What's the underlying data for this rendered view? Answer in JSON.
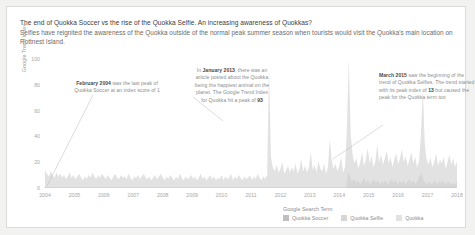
{
  "header": {
    "title": "The end of Quokka Soccer vs the rise of the Quokka Selfie. An increasing awareness of Quokkas?",
    "subtitle": "Selfies have reignited the awareness of the Quokka outside of the normal peak summer season when tourists would visit the Quokka's main location on Rottnest Island."
  },
  "annotations": {
    "a1": {
      "bold": "February 2004",
      "rest": " was the last peak of Quokka Soccer at an index score of 1"
    },
    "a2": {
      "pre": "In ",
      "bold": "January 2013",
      "mid": ", there was an article posted about the Quokka being the happiest animal on the planet. The Google Trend Index for Quokka hit a peak of ",
      "bold2": "93"
    },
    "a3": {
      "bold": "March 2015",
      "mid": " saw the beginning of the trend of Quokka Selfies. The trend started with its peak index of ",
      "bold2": "13",
      "rest": " but caused the peak for the Quokka term too"
    }
  },
  "legend": {
    "title": "Google Search Term",
    "items": [
      {
        "label": "Quokka Soccer",
        "color": "#bfbfbf"
      },
      {
        "label": "Quokka Selfie",
        "color": "#d6d6d6"
      },
      {
        "label": "Quokka",
        "color": "#e2e2e2"
      }
    ]
  },
  "chart_data": {
    "type": "area",
    "title": "The end of Quokka Soccer vs the rise of the Quokka Selfie. An increasing awareness of Quokkas?",
    "xlabel": "",
    "ylabel": "Google Trend Index",
    "ylim": [
      0,
      100
    ],
    "yticks": [
      0,
      20,
      40,
      60,
      80,
      100
    ],
    "xlim": [
      "2004",
      "2018"
    ],
    "xticks": [
      "2004",
      "2005",
      "2006",
      "2007",
      "2008",
      "2009",
      "2010",
      "2011",
      "2012",
      "2013",
      "2014",
      "2015",
      "2016",
      "2017",
      "2018"
    ],
    "grid": false,
    "legend_position": "bottom-right",
    "series": [
      {
        "name": "Quokka",
        "color": "#e2e2e2",
        "values": [
          14,
          11,
          9,
          13,
          10,
          8,
          12,
          9,
          11,
          8,
          10,
          7,
          9,
          12,
          8,
          10,
          7,
          9,
          11,
          8,
          6,
          9,
          7,
          10,
          8,
          12,
          9,
          7,
          10,
          8,
          11,
          9,
          7,
          10,
          8,
          6,
          9,
          11,
          8,
          7,
          10,
          8,
          9,
          7,
          11,
          8,
          6,
          9,
          8,
          10,
          7,
          9,
          11,
          8,
          7,
          9,
          6,
          8,
          10,
          7,
          9,
          11,
          8,
          6,
          9,
          7,
          10,
          8,
          6,
          9,
          7,
          11,
          8,
          6,
          9,
          7,
          8,
          10,
          7,
          9,
          6,
          8,
          11,
          7,
          9,
          6,
          8,
          10,
          7,
          9,
          6,
          8,
          7,
          10,
          6,
          9,
          7,
          8,
          11,
          6,
          9,
          7,
          10,
          8,
          6,
          9,
          7,
          8,
          10,
          6,
          9,
          7,
          11,
          8,
          6,
          9,
          7,
          10,
          93,
          24,
          16,
          13,
          18,
          12,
          15,
          20,
          11,
          14,
          17,
          12,
          16,
          13,
          19,
          11,
          15,
          22,
          13,
          17,
          12,
          16,
          28,
          14,
          18,
          12,
          21,
          15,
          13,
          19,
          11,
          16,
          38,
          22,
          15,
          19,
          13,
          17,
          24,
          12,
          16,
          45,
          100,
          42,
          26,
          19,
          23,
          15,
          20,
          28,
          17,
          22,
          31,
          19,
          25,
          16,
          21,
          34,
          20,
          26,
          18,
          23,
          29,
          19,
          24,
          16,
          22,
          27,
          18,
          23,
          30,
          20,
          25,
          17,
          22,
          28,
          19,
          24,
          16,
          21,
          41,
          78,
          35,
          22,
          18,
          24,
          16,
          20,
          27,
          17,
          22,
          19,
          24,
          15,
          20,
          26,
          18,
          23,
          16,
          21
        ]
      },
      {
        "name": "Quokka Selfie",
        "color": "#d6d6d6",
        "values": [
          0,
          0,
          0,
          0,
          0,
          0,
          0,
          0,
          0,
          0,
          0,
          0,
          0,
          0,
          0,
          0,
          0,
          0,
          0,
          0,
          0,
          0,
          0,
          0,
          0,
          0,
          0,
          0,
          0,
          0,
          0,
          0,
          0,
          0,
          0,
          0,
          0,
          0,
          0,
          0,
          0,
          0,
          0,
          0,
          0,
          0,
          0,
          0,
          0,
          0,
          0,
          0,
          0,
          0,
          0,
          0,
          0,
          0,
          0,
          0,
          0,
          0,
          0,
          0,
          0,
          0,
          0,
          0,
          0,
          0,
          0,
          0,
          0,
          0,
          0,
          0,
          0,
          0,
          0,
          0,
          0,
          0,
          0,
          0,
          0,
          0,
          0,
          0,
          0,
          0,
          0,
          0,
          0,
          0,
          0,
          0,
          0,
          0,
          0,
          0,
          0,
          0,
          0,
          0,
          0,
          0,
          0,
          0,
          0,
          0,
          0,
          0,
          0,
          0,
          0,
          0,
          0,
          0,
          0,
          0,
          0,
          0,
          0,
          0,
          0,
          0,
          0,
          0,
          0,
          0,
          0,
          0,
          0,
          0,
          0,
          0,
          0,
          0,
          0,
          0,
          0,
          0,
          0,
          0,
          0,
          0,
          0,
          0,
          0,
          0,
          0,
          0,
          0,
          13,
          9,
          5,
          7,
          4,
          6,
          3,
          5,
          8,
          4,
          6,
          3,
          5,
          7,
          4,
          6,
          3,
          5,
          4,
          6,
          3,
          5,
          7,
          4,
          6,
          3,
          5,
          4,
          6,
          3,
          5,
          7,
          4,
          6,
          3,
          5,
          9,
          12,
          6,
          4,
          3,
          5,
          3,
          4,
          6,
          3,
          5,
          4,
          6,
          3,
          4,
          5,
          3,
          4,
          3,
          5
        ]
      },
      {
        "name": "Quokka Soccer",
        "color": "#bfbfbf",
        "values": [
          1,
          0,
          0,
          0,
          0,
          0,
          0,
          0,
          0,
          0,
          0,
          0,
          0,
          0,
          0,
          0,
          0,
          0,
          0,
          0,
          0,
          0,
          0,
          0,
          0,
          0,
          0,
          0,
          0,
          0,
          0,
          0,
          0,
          0,
          0,
          0,
          0,
          0,
          0,
          0,
          0,
          0,
          0,
          0,
          0,
          0,
          0,
          0,
          0,
          0,
          0,
          0,
          0,
          0,
          0,
          0,
          0,
          0,
          0,
          0,
          0,
          0,
          0,
          0,
          0,
          0,
          0,
          0,
          0,
          0,
          0,
          0,
          0,
          0,
          0,
          0,
          0,
          0,
          0,
          0,
          0,
          0,
          0,
          0,
          0,
          0,
          0,
          0,
          0,
          0,
          0,
          0,
          0,
          0,
          0,
          0,
          0,
          0,
          0,
          0,
          0,
          0,
          0,
          0,
          0,
          0,
          0,
          0,
          0,
          0,
          0,
          0,
          0,
          0,
          0,
          0,
          0,
          0,
          0,
          0,
          0,
          0,
          0,
          0,
          0,
          0,
          0,
          0,
          0,
          0,
          0,
          0,
          0,
          0,
          0,
          0,
          0,
          0,
          0,
          0,
          0,
          0,
          0,
          0,
          0,
          0,
          0,
          0,
          0,
          0,
          0,
          0,
          0,
          0,
          0,
          0,
          0,
          0,
          0,
          0,
          0,
          0,
          0,
          0,
          0,
          0,
          0,
          0,
          0,
          0,
          0,
          0,
          0,
          0,
          0,
          0,
          0,
          0,
          0,
          0,
          0,
          0,
          0,
          0,
          0,
          0,
          0,
          0,
          0,
          0,
          0,
          0,
          0,
          0,
          0,
          0,
          0,
          0,
          0,
          0,
          0,
          0,
          0,
          0,
          0,
          0,
          0,
          0,
          0,
          0,
          0,
          0,
          0,
          0,
          0,
          0,
          0,
          0,
          0
        ]
      }
    ]
  }
}
